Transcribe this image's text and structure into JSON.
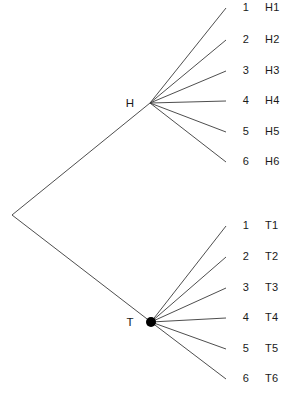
{
  "diagram": {
    "background_color": "#ffffff",
    "line_color": "#3a3a3a",
    "text_color": "#1a1a1a",
    "root": {
      "name": "root-vertex",
      "x": 12,
      "y": 215,
      "marker": "none"
    },
    "branches": [
      {
        "id": "heads",
        "label": "H",
        "node_x": 150,
        "node_y": 103,
        "label_x": 123,
        "label_y": 98,
        "marker": "none",
        "outcomes": [
          {
            "index": "1",
            "name": "H1",
            "end_x": 226,
            "end_y": 8
          },
          {
            "index": "2",
            "name": "H2",
            "end_x": 226,
            "end_y": 40
          },
          {
            "index": "3",
            "name": "H3",
            "end_x": 226,
            "end_y": 71
          },
          {
            "index": "4",
            "name": "H4",
            "end_x": 226,
            "end_y": 101
          },
          {
            "index": "5",
            "name": "H5",
            "end_x": 226,
            "end_y": 132
          },
          {
            "index": "6",
            "name": "H6",
            "end_x": 226,
            "end_y": 162
          }
        ]
      },
      {
        "id": "tails",
        "label": "T",
        "node_x": 151,
        "node_y": 322,
        "label_x": 123,
        "label_y": 317,
        "marker": "filled-dot",
        "marker_radius": 5,
        "outcomes": [
          {
            "index": "1",
            "name": "T1",
            "end_x": 226,
            "end_y": 226
          },
          {
            "index": "2",
            "name": "T2",
            "end_x": 226,
            "end_y": 257
          },
          {
            "index": "3",
            "name": "T3",
            "end_x": 226,
            "end_y": 288
          },
          {
            "index": "4",
            "name": "T4",
            "end_x": 226,
            "end_y": 318
          },
          {
            "index": "5",
            "name": "T5",
            "end_x": 226,
            "end_y": 349
          },
          {
            "index": "6",
            "name": "T6",
            "end_x": 226,
            "end_y": 379
          }
        ]
      }
    ],
    "index_label_x": 237,
    "name_label_x": 265
  },
  "chart_data": {
    "type": "tree",
    "title": "",
    "levels": [
      {
        "level": 1,
        "nodes": [
          "H",
          "T"
        ]
      },
      {
        "level": 2,
        "nodes": [
          "1",
          "2",
          "3",
          "4",
          "5",
          "6"
        ]
      }
    ],
    "outcomes": [
      "H1",
      "H2",
      "H3",
      "H4",
      "H5",
      "H6",
      "T1",
      "T2",
      "T3",
      "T4",
      "T5",
      "T6"
    ],
    "outcome_count": 12
  }
}
